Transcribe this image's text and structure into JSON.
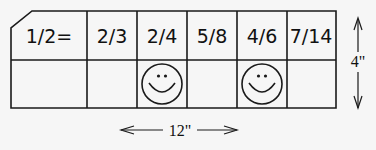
{
  "diagram": {
    "header_cells": [
      "1/2=",
      "2/3",
      "2/4",
      "5/8",
      "4/6",
      "7/14"
    ],
    "answer_cells": [
      "",
      "",
      "smiley",
      "",
      "smiley",
      ""
    ],
    "icons": {
      "smiley": "smiley-face-icon"
    },
    "dimensions": {
      "width_label": "12\"",
      "height_label": "4\""
    }
  }
}
